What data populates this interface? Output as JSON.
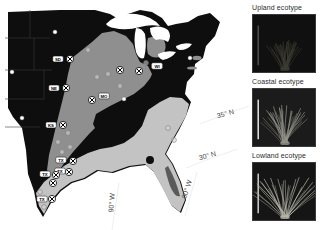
{
  "map": {
    "region_colors": {
      "upland_black": "#0e0e0e",
      "intermediate_gray": "#8f8f8f",
      "coastal_light": "#c3c3c3",
      "water_white": "#ffffff",
      "interior_patch": "#5a5a5a"
    },
    "coordinate_labels": [
      {
        "text": "35° N",
        "x": 226,
        "y": 116,
        "rot": -14
      },
      {
        "text": "30° N",
        "x": 208,
        "y": 158,
        "rot": -14
      },
      {
        "text": "90° W",
        "x": 114,
        "y": 203,
        "rot": -86
      },
      {
        "text": "80° W",
        "x": 189,
        "y": 190,
        "rot": -72
      }
    ],
    "markers": [
      {
        "type": "dot",
        "x": 55,
        "y": 32
      },
      {
        "type": "dot",
        "x": 12,
        "y": 72
      },
      {
        "type": "dot",
        "x": 190,
        "y": 58
      },
      {
        "type": "dot",
        "x": 22,
        "y": 118
      },
      {
        "type": "dot",
        "x": 124,
        "y": 99
      },
      {
        "type": "ring",
        "x": 88,
        "y": 50
      },
      {
        "type": "ring",
        "x": 97,
        "y": 77
      },
      {
        "type": "ring",
        "x": 108,
        "y": 74
      },
      {
        "type": "ring",
        "x": 120,
        "y": 86
      },
      {
        "type": "ring",
        "x": 146,
        "y": 63,
        "label": "WI",
        "lx": 157,
        "ly": 66,
        "light": true
      },
      {
        "type": "ring",
        "x": 68,
        "y": 133
      },
      {
        "type": "ring",
        "x": 58,
        "y": 142
      },
      {
        "type": "ring",
        "x": 70,
        "y": 147
      },
      {
        "type": "ring",
        "x": 62,
        "y": 152
      },
      {
        "type": "ring",
        "x": 40,
        "y": 192
      },
      {
        "type": "ring",
        "x": 44,
        "y": 207
      },
      {
        "type": "ring",
        "x": 168,
        "y": 128
      },
      {
        "type": "ring",
        "x": 174,
        "y": 140
      },
      {
        "type": "xsite",
        "x": 70,
        "y": 59,
        "label": "SD",
        "lx": 58,
        "ly": 59
      },
      {
        "type": "xsite",
        "x": 66,
        "y": 88,
        "label": "NE",
        "lx": 54,
        "ly": 88
      },
      {
        "type": "xsite",
        "x": 92,
        "y": 100,
        "label": "MO",
        "lx": 104,
        "ly": 96
      },
      {
        "type": "xsite",
        "x": 120,
        "y": 70
      },
      {
        "type": "xsite",
        "x": 139,
        "y": 71
      },
      {
        "type": "xsite",
        "x": 63,
        "y": 125,
        "label": "KS",
        "lx": 51,
        "ly": 125
      },
      {
        "type": "xsite",
        "x": 73,
        "y": 161,
        "label": "TX",
        "lx": 61,
        "ly": 160
      },
      {
        "type": "xsite",
        "x": 69,
        "y": 172,
        "label": "TX",
        "lx": 60,
        "ly": 171
      },
      {
        "type": "xsite",
        "x": 56,
        "y": 175,
        "label": "TX",
        "lx": 45,
        "ly": 174
      },
      {
        "type": "xsite",
        "x": 53,
        "y": 183
      },
      {
        "type": "xsite",
        "x": 52,
        "y": 199,
        "label": "TX",
        "lx": 42,
        "ly": 199
      }
    ]
  },
  "panels": [
    {
      "label": "Upland ecotype",
      "bg": "#101010",
      "plant_color": "#3d3d33",
      "scalebar_color": "#9a9a9a",
      "spread": 55,
      "len": 30
    },
    {
      "label": "Coastal ecotype",
      "bg": "#1b1b1b",
      "plant_color": "#94948b",
      "scalebar_color": "#e9e9e9",
      "spread": 78,
      "len": 40
    },
    {
      "label": "Lowland ecotype",
      "bg": "#151515",
      "plant_color": "#b8b8ab",
      "scalebar_color": "#d2d2d2",
      "spread": 96,
      "len": 46
    }
  ]
}
